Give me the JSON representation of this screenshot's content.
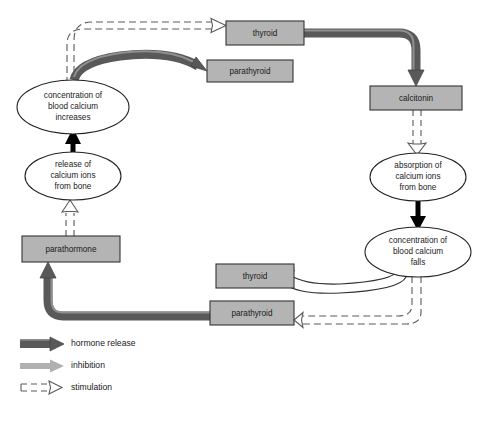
{
  "diagram": {
    "canvas": {
      "width": 481,
      "height": 421,
      "background": "#ffffff"
    },
    "colors": {
      "box_fill": "#b4b4b4",
      "box_stroke": "#333333",
      "ellipse_fill": "#ffffff",
      "ellipse_stroke": "#222222",
      "hormone_release_arrow": "#595959",
      "hormone_release_highlight": "#8c8c8c",
      "inhibition_arrow": "#b0b0b0",
      "stimulation_arrow_stroke": "#5a5a5a",
      "black_arrow": "#000000",
      "text": "#1a1a1a"
    },
    "boxes": [
      {
        "id": "thyroid-top",
        "label": "thyroid",
        "x": 226,
        "y": 21,
        "w": 78,
        "h": 24
      },
      {
        "id": "parathyroid-top",
        "label": "parathyroid",
        "x": 207,
        "y": 60,
        "w": 86,
        "h": 22
      },
      {
        "id": "calcitonin",
        "label": "calcitonin",
        "x": 370,
        "y": 86,
        "w": 92,
        "h": 24
      },
      {
        "id": "parathormone",
        "label": "parathormone",
        "x": 22,
        "y": 236,
        "w": 98,
        "h": 26
      },
      {
        "id": "thyroid-bottom",
        "label": "thyroid",
        "x": 216,
        "y": 264,
        "w": 78,
        "h": 24
      },
      {
        "id": "parathyroid-bottom",
        "label": "parathyroid",
        "x": 210,
        "y": 301,
        "w": 84,
        "h": 24
      }
    ],
    "ellipses": [
      {
        "id": "blood-calcium-increases",
        "lines": [
          "concentration of",
          "blood calcium",
          "increases"
        ],
        "cx": 73,
        "cy": 107,
        "rx": 56,
        "ry": 27
      },
      {
        "id": "release-calcium-from-bone",
        "lines": [
          "release of",
          "calcium ions",
          "from bone"
        ],
        "cx": 73,
        "cy": 176,
        "rx": 48,
        "ry": 24
      },
      {
        "id": "absorption-calcium-from-bone",
        "lines": [
          "absorption of",
          "calcium ions",
          "from bone"
        ],
        "cx": 418,
        "cy": 177,
        "rx": 48,
        "ry": 24
      },
      {
        "id": "blood-calcium-falls",
        "lines": [
          "concentration of",
          "blood calcium",
          "falls"
        ],
        "cx": 418,
        "cy": 252,
        "rx": 53,
        "ry": 25
      }
    ],
    "legend": {
      "items": [
        {
          "id": "hormone-release",
          "label": "hormone release",
          "style": "thick-dark-arrow"
        },
        {
          "id": "inhibition",
          "label": "inhibition",
          "style": "light-gray-arrow"
        },
        {
          "id": "stimulation",
          "label": "stimulation",
          "style": "dashed-outline-arrow"
        }
      ]
    },
    "connections": [
      {
        "from": "blood-calcium-increases",
        "to": "thyroid-top",
        "type": "stimulation"
      },
      {
        "from": "blood-calcium-increases",
        "to": "parathyroid-top",
        "type": "hormone release"
      },
      {
        "from": "thyroid-top",
        "to": "calcitonin",
        "type": "hormone release"
      },
      {
        "from": "calcitonin",
        "to": "absorption-calcium-from-bone",
        "type": "stimulation"
      },
      {
        "from": "absorption-calcium-from-bone",
        "to": "blood-calcium-falls",
        "type": "black"
      },
      {
        "from": "blood-calcium-falls",
        "to": "thyroid-bottom",
        "type": "inhibition"
      },
      {
        "from": "blood-calcium-falls",
        "to": "parathyroid-bottom",
        "type": "stimulation"
      },
      {
        "from": "parathyroid-bottom",
        "to": "parathormone",
        "type": "hormone release"
      },
      {
        "from": "parathormone",
        "to": "release-calcium-from-bone",
        "type": "stimulation"
      },
      {
        "from": "release-calcium-from-bone",
        "to": "blood-calcium-increases",
        "type": "black"
      }
    ]
  }
}
